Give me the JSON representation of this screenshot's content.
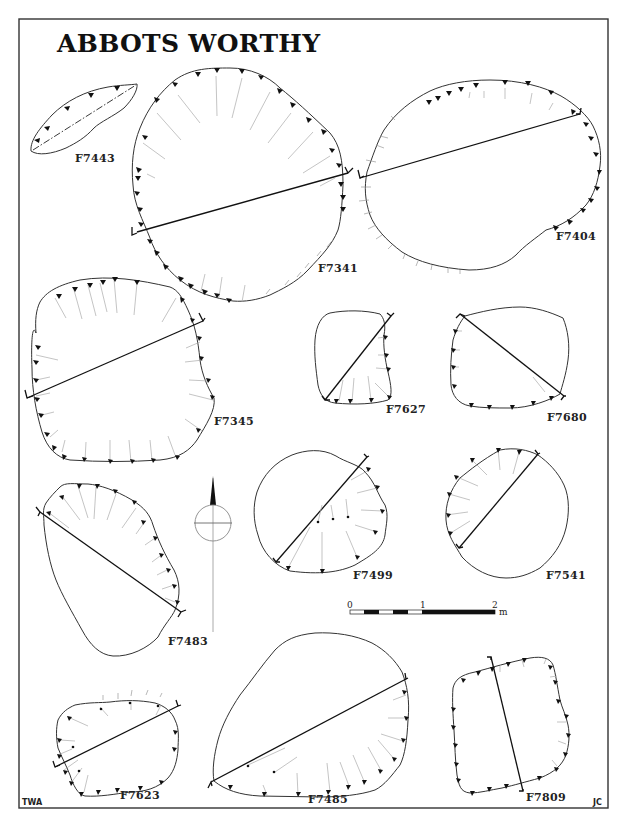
{
  "figure": {
    "title": "ABBOTS WORTHY",
    "credits": {
      "left": "TWA",
      "right": "JC"
    },
    "caption_visible": false
  },
  "scale_bar": {
    "labels": [
      "0",
      "1",
      "2"
    ],
    "unit": "m"
  },
  "north_arrow": {
    "direction": "N"
  },
  "features": [
    {
      "id": "F7443",
      "label": "F7443"
    },
    {
      "id": "F7341",
      "label": "F7341"
    },
    {
      "id": "F7404",
      "label": "F7404"
    },
    {
      "id": "F7345",
      "label": "F7345"
    },
    {
      "id": "F7627",
      "label": "F7627"
    },
    {
      "id": "F7680",
      "label": "F7680"
    },
    {
      "id": "F7483",
      "label": "F7483"
    },
    {
      "id": "F7499",
      "label": "F7499"
    },
    {
      "id": "F7541",
      "label": "F7541"
    },
    {
      "id": "F7623",
      "label": "F7623"
    },
    {
      "id": "F7485",
      "label": "F7485"
    },
    {
      "id": "F7809",
      "label": "F7809"
    }
  ],
  "colors": {
    "ink": "#111111",
    "hachure": "#aaaaaa",
    "background": "#ffffff"
  }
}
